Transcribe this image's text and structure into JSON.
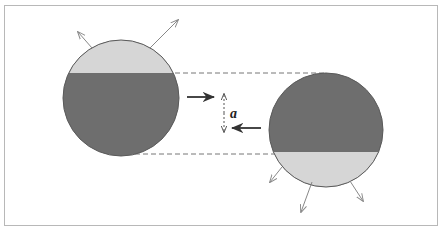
{
  "diagram": {
    "type": "physics-schematic",
    "frame": {
      "stroke": "#b8b8b8"
    },
    "colors": {
      "dark_fill": "#6e6e6e",
      "light_fill": "#d6d6d6",
      "outline": "#5a5a5a",
      "dashed": "#777777",
      "arrow": "#333333",
      "thin_arrow": "#888888"
    },
    "left_body": {
      "cx": 121,
      "cy": 98,
      "r": 58,
      "light_cap_boundary_y": 73,
      "light_cap_side": "top",
      "emission_arrows": [
        {
          "x1": 92,
          "y1": 48,
          "x2": 78,
          "y2": 32
        },
        {
          "x1": 150,
          "y1": 48,
          "x2": 178,
          "y2": 20
        }
      ]
    },
    "right_body": {
      "cx": 326,
      "cy": 130,
      "r": 57,
      "light_cap_boundary_y": 152,
      "light_cap_side": "bottom",
      "emission_arrows": [
        {
          "x1": 282,
          "y1": 167,
          "x2": 270,
          "y2": 182
        },
        {
          "x1": 312,
          "y1": 182,
          "x2": 301,
          "y2": 212
        },
        {
          "x1": 350,
          "y1": 181,
          "x2": 363,
          "y2": 201
        }
      ]
    },
    "dashed_lines": [
      {
        "x1": 175,
        "y1": 73,
        "x2": 325,
        "y2": 73
      },
      {
        "x1": 135,
        "y1": 154,
        "x2": 276,
        "y2": 154
      }
    ],
    "motion_arrows": [
      {
        "name": "left-body-motion",
        "x1": 187,
        "y1": 97,
        "x2": 214,
        "y2": 97
      },
      {
        "name": "right-body-motion",
        "x1": 261,
        "y1": 128,
        "x2": 232,
        "y2": 128
      }
    ],
    "separation": {
      "x": 224,
      "y1": 94,
      "y2": 132,
      "label": "a",
      "label_x": 230,
      "label_y": 118
    }
  }
}
